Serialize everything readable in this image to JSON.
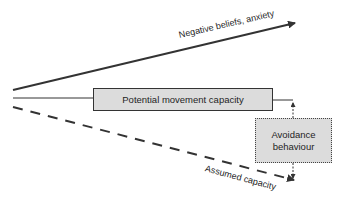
{
  "diagram": {
    "top_arrow": {
      "label": "Negative beliefs, anxiety",
      "color": "#333333"
    },
    "middle_bar": {
      "label": "Potential movement capacity",
      "fill": "#dcdcdc"
    },
    "dashed_arrow": {
      "label": "Assumed capacity",
      "color": "#333333"
    },
    "avoidance_box": {
      "line1": "Avoidance",
      "line2": "behaviour",
      "fill": "#dcdcdc"
    }
  }
}
